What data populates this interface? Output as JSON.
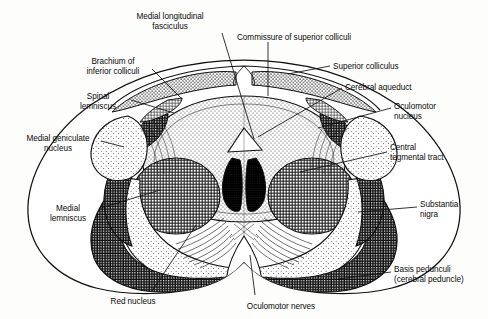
{
  "figure": {
    "type": "anatomical-line-drawing",
    "palette": {
      "ink": "#101010",
      "paper": "#fdfdfb",
      "basis_pedunculi": "#3c3c3c",
      "red_nucleus": "#808080",
      "medial_geniculate": "#b8b8b8",
      "oculomotor_nucleus": "#aaaaaa",
      "substantia_nigra": "#e2e2e2",
      "periaqueductal_gray": "#cfcfcf",
      "superior_colliculus": "#c4c4c4",
      "spinal_lemniscus": "#555555",
      "central_tegmental": "#d5d5d5"
    }
  },
  "labels": [
    {
      "id": "medial-longitudinal-fasciculus",
      "text": "Medial longitudinal\nfasciculus",
      "align": "center",
      "x": 170,
      "y": 12
    },
    {
      "id": "commissure-of-superior-colliculi",
      "text": "Commissure of superior colliculi",
      "align": "left",
      "x": 237,
      "y": 33
    },
    {
      "id": "brachium-of-inferior-colliculi",
      "text": "Brachium of\ninferior colliculi",
      "align": "center",
      "x": 113,
      "y": 57
    },
    {
      "id": "superior-colliculus",
      "text": "Superior colliculus",
      "align": "left",
      "x": 333,
      "y": 62
    },
    {
      "id": "spinal-lemniscus",
      "text": "Spinal\nlemniscus",
      "align": "center",
      "x": 98,
      "y": 92
    },
    {
      "id": "cerebral-aqueduct",
      "text": "Cerebral aqueduct",
      "align": "left",
      "x": 345,
      "y": 83
    },
    {
      "id": "oculomotor-nucleus",
      "text": "Oculomotor\nnucleus",
      "align": "left",
      "x": 394,
      "y": 102
    },
    {
      "id": "medial-geniculate-nucleus",
      "text": "Medial geniculate\nnucleus",
      "align": "center",
      "x": 58,
      "y": 134
    },
    {
      "id": "central-tegmental-tract",
      "text": "Central\ntegmental tract",
      "align": "left",
      "x": 390,
      "y": 143
    },
    {
      "id": "medial-lemniscus",
      "text": "Medial\nlemniscus",
      "align": "center",
      "x": 68,
      "y": 204
    },
    {
      "id": "substantia-nigra",
      "text": "Substantia\nnigra",
      "align": "left",
      "x": 420,
      "y": 200
    },
    {
      "id": "basis-pedunculi",
      "text": "Basis pedunculi\n(cerebral peduncle)",
      "align": "left",
      "x": 394,
      "y": 265
    },
    {
      "id": "red-nucleus",
      "text": "Red nucleus",
      "align": "center",
      "x": 133,
      "y": 297
    },
    {
      "id": "oculomotor-nerves",
      "text": "Oculomotor nerves",
      "align": "center",
      "x": 281,
      "y": 302
    }
  ],
  "leaders": [
    {
      "id": "leader-medial-longitudinal-fasciculus",
      "points": "222,33 254,139"
    },
    {
      "id": "leader-commissure",
      "points": "268,42 268,96"
    },
    {
      "id": "leader-brachium",
      "points": "152,69 182,99"
    },
    {
      "id": "leader-superior-colliculus",
      "points": "330,66 288,74"
    },
    {
      "id": "leader-spinal-lemniscus",
      "points": "131,100 174,113"
    },
    {
      "id": "leader-cerebral-aqueduct",
      "points": "342,88 258,137"
    },
    {
      "id": "leader-oculomotor-nucleus",
      "points": "391,108 318,128"
    },
    {
      "id": "leader-medial-geniculate",
      "points": "101,141 124,147"
    },
    {
      "id": "leader-central-tegmental",
      "points": "387,152 300,172"
    },
    {
      "id": "leader-medial-lemniscus",
      "points": "101,208 160,190"
    },
    {
      "id": "leader-substantia-nigra",
      "points": "417,207 358,212"
    },
    {
      "id": "leader-basis-pedunculi",
      "points": "391,272 338,279"
    },
    {
      "id": "leader-red-nucleus",
      "points": "152,291 196,225"
    },
    {
      "id": "leader-oculomotor-nerves",
      "points": "255,295 250,255"
    }
  ],
  "structures": [
    {
      "id": "superior-colliculus-left",
      "name": "Superior colliculus (left)",
      "shading": "stipple-medium"
    },
    {
      "id": "superior-colliculus-right",
      "name": "Superior colliculus (right)",
      "shading": "stipple-medium"
    },
    {
      "id": "periaqueductal-gray",
      "name": "Periaqueductal gray matter",
      "shading": "stipple-fine"
    },
    {
      "id": "cerebral-aqueduct-lumen",
      "name": "Cerebral aqueduct",
      "shading": "white"
    },
    {
      "id": "oculomotor-nucleus-left",
      "name": "Oculomotor nucleus (left)",
      "shading": "solid-dark"
    },
    {
      "id": "oculomotor-nucleus-right",
      "name": "Oculomotor nucleus (right)",
      "shading": "solid-dark"
    },
    {
      "id": "red-nucleus-left",
      "name": "Red nucleus (left)",
      "shading": "crosshatch-medium"
    },
    {
      "id": "red-nucleus-right",
      "name": "Red nucleus (right)",
      "shading": "crosshatch-medium"
    },
    {
      "id": "substantia-nigra-left",
      "name": "Substantia nigra (left)",
      "shading": "stipple-light"
    },
    {
      "id": "substantia-nigra-right",
      "name": "Substantia nigra (right)",
      "shading": "stipple-light"
    },
    {
      "id": "basis-pedunculi-left",
      "name": "Basis pedunculi (left)",
      "shading": "crosshatch-dark"
    },
    {
      "id": "basis-pedunculi-right",
      "name": "Basis pedunculi (right)",
      "shading": "crosshatch-dark"
    },
    {
      "id": "medial-geniculate-left",
      "name": "Medial geniculate nucleus (left)",
      "shading": "stipple-light"
    },
    {
      "id": "medial-geniculate-right",
      "name": "Medial geniculate nucleus (right)",
      "shading": "stipple-light"
    },
    {
      "id": "brachium-inferior-colliculi",
      "name": "Brachium of inferior colliculi",
      "shading": "crosshatch-fine"
    },
    {
      "id": "spinal-lemniscus-band",
      "name": "Spinal lemniscus",
      "shading": "crosshatch-dark"
    },
    {
      "id": "medial-lemniscus-band",
      "name": "Medial lemniscus",
      "shading": "crosshatch-dark"
    },
    {
      "id": "oculomotor-nerve-fibers",
      "name": "Oculomotor nerve fibers",
      "shading": "line-fibers"
    },
    {
      "id": "interpeduncular-fossa",
      "name": "Interpeduncular fossa",
      "shading": "white"
    },
    {
      "id": "decussation-fibers",
      "name": "Decussation of superior cerebellar peduncles",
      "shading": "line-fibers"
    }
  ]
}
